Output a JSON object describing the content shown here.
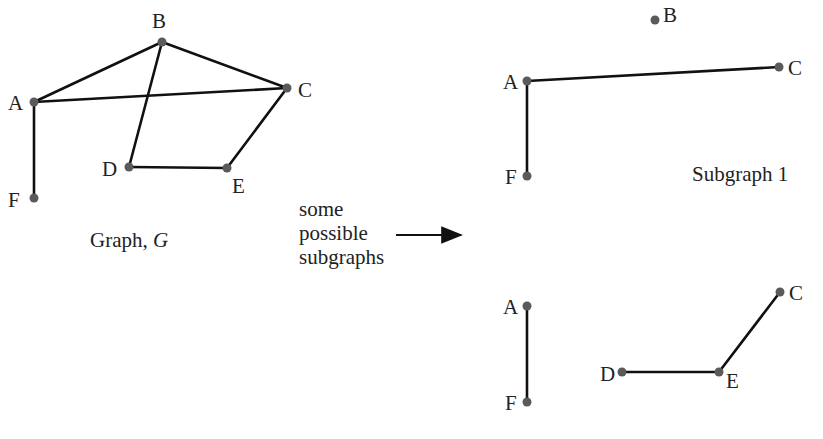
{
  "main_graph": {
    "caption": "Graph, ",
    "caption_var": "G",
    "nodes": [
      {
        "id": "A",
        "x": 34,
        "y": 102
      },
      {
        "id": "B",
        "x": 162,
        "y": 42
      },
      {
        "id": "C",
        "x": 287,
        "y": 88
      },
      {
        "id": "D",
        "x": 129,
        "y": 167
      },
      {
        "id": "E",
        "x": 227,
        "y": 168
      },
      {
        "id": "F",
        "x": 34,
        "y": 198
      }
    ],
    "edges": [
      [
        "A",
        "B"
      ],
      [
        "B",
        "C"
      ],
      [
        "A",
        "C"
      ],
      [
        "B",
        "D"
      ],
      [
        "D",
        "E"
      ],
      [
        "E",
        "C"
      ],
      [
        "A",
        "F"
      ]
    ]
  },
  "arrow_text": {
    "line1": "some",
    "line2": "possible",
    "line3": "subgraphs"
  },
  "subgraph1": {
    "caption": "Subgraph 1",
    "nodes": [
      {
        "id": "B",
        "x": 655,
        "y": 20
      },
      {
        "id": "A",
        "x": 527,
        "y": 81
      },
      {
        "id": "C",
        "x": 779,
        "y": 67
      },
      {
        "id": "F",
        "x": 527,
        "y": 176
      }
    ],
    "edges": [
      [
        "A",
        "C"
      ],
      [
        "A",
        "F"
      ]
    ]
  },
  "subgraph2": {
    "nodes": [
      {
        "id": "A",
        "x": 527,
        "y": 306
      },
      {
        "id": "F",
        "x": 527,
        "y": 402
      },
      {
        "id": "C",
        "x": 780,
        "y": 292
      },
      {
        "id": "D",
        "x": 622,
        "y": 372
      },
      {
        "id": "E",
        "x": 719,
        "y": 372
      }
    ],
    "edges": [
      [
        "A",
        "F"
      ],
      [
        "D",
        "E"
      ],
      [
        "E",
        "C"
      ]
    ]
  }
}
